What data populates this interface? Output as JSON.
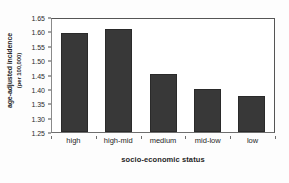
{
  "chart_data": {
    "type": "bar",
    "title": "",
    "categories": [
      "high",
      "high-mid",
      "medium",
      "mid-low",
      "low"
    ],
    "values": [
      1.595,
      1.607,
      1.451,
      1.401,
      1.375
    ],
    "xlabel": "socio-economic status",
    "ylabel": "age-adjusted incidence",
    "ylabel_line2": "(per 100,000)",
    "ylim": [
      1.25,
      1.65
    ],
    "ytick_labels": [
      "1.25",
      "1.30",
      "1.35",
      "1.40",
      "1.45",
      "1.50",
      "1.55",
      "1.60",
      "1.65"
    ],
    "ytick_values": [
      1.25,
      1.3,
      1.35,
      1.4,
      1.45,
      1.5,
      1.55,
      1.6,
      1.65
    ],
    "grid": false,
    "legend": "none",
    "bar_color": "#383838",
    "background_color": "#ffffff",
    "axis_color": "#555555"
  }
}
